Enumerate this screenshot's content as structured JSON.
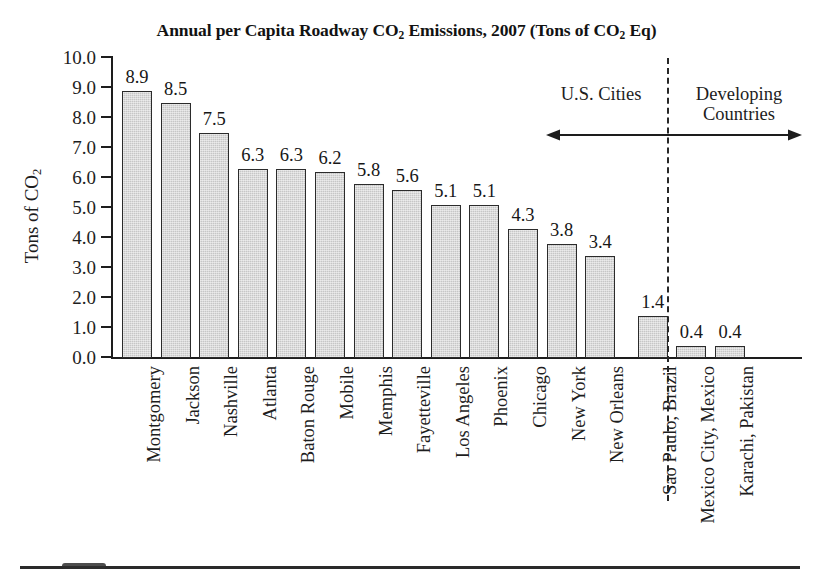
{
  "chart_data": {
    "type": "bar",
    "title": "Annual per Capita Roadway CO2 Emissions, 2007 (Tons of CO2 Eq)",
    "title_parts": {
      "a": "Annual per Capita Roadway CO",
      "sub1": "2",
      "b": " Emissions, 2007 (Tons of CO",
      "sub2": "2",
      "c": " Eq)"
    },
    "xlabel": "",
    "ylabel": "Tons of CO2",
    "ylabel_parts": {
      "a": "Tons of CO",
      "sub": "2"
    },
    "ylim": [
      0.0,
      10.0
    ],
    "ytick_step": 1.0,
    "grid": false,
    "legend": "none",
    "ytick_labels": [
      "10.0",
      "9.0",
      "8.0",
      "7.0",
      "6.0",
      "5.0",
      "4.0",
      "3.0",
      "2.0",
      "1.0",
      "0.0"
    ],
    "categories": [
      "Montgomery",
      "Jackson",
      "Nashville",
      "Atlanta",
      "Baton Rouge",
      "Mobile",
      "Memphis",
      "Fayetteville",
      "Los Angeles",
      "Phoenix",
      "Chicago",
      "New York",
      "New Orleans",
      "Sao Paulo, Brazil",
      "Mexico City, Mexico",
      "Karachi, Pakistan"
    ],
    "values": [
      8.9,
      8.5,
      7.5,
      6.3,
      6.3,
      6.2,
      5.8,
      5.6,
      5.1,
      5.1,
      4.3,
      3.8,
      3.4,
      1.4,
      0.4,
      0.4
    ],
    "value_labels": [
      "8.9",
      "8.5",
      "7.5",
      "6.3",
      "6.3",
      "6.2",
      "5.8",
      "5.6",
      "5.1",
      "5.1",
      "4.3",
      "3.8",
      "3.4",
      "1.4",
      "0.4",
      "0.4"
    ],
    "bar_fill_color": "#c6c6c6",
    "bar_edge_color": "#2b2b2b",
    "annotations": {
      "group_left_label": "U.S. Cities",
      "group_right_label_line1": "Developing",
      "group_right_label_line2": "Countries",
      "divider_style": "dashed",
      "arrow_style": "double-headed"
    }
  }
}
